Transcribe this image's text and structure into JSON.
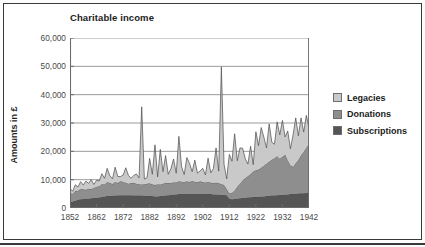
{
  "chart_data": {
    "type": "area",
    "stacked": true,
    "title": "Charitable income",
    "xlabel": "",
    "ylabel": "Amounts in £",
    "ylim": [
      0,
      60000
    ],
    "ytick_labels": [
      "0",
      "10,000",
      "20,000",
      "30,000",
      "40,000",
      "50,000",
      "60,000"
    ],
    "ytick_values": [
      0,
      10000,
      20000,
      30000,
      40000,
      50000,
      60000
    ],
    "xlim": [
      1852,
      1942
    ],
    "xtick_labels": [
      "1852",
      "1862",
      "1872",
      "1882",
      "1892",
      "1902",
      "1912",
      "1922",
      "1932",
      "1942"
    ],
    "xtick_values": [
      1852,
      1862,
      1872,
      1882,
      1892,
      1902,
      1912,
      1922,
      1932,
      1942
    ],
    "grid": "horizontal",
    "legend_position": "right",
    "colors": {
      "legacies": "#c9c9c9",
      "donations": "#8e8e8e",
      "subscriptions": "#555555",
      "outline": "#3a3a3a",
      "gridline": "#8f8f8f",
      "axis": "#6a6a6a",
      "frame": "#3a3a3a"
    },
    "legend": [
      {
        "label": "Legacies",
        "color": "#c9c9c9"
      },
      {
        "label": "Donations",
        "color": "#8e8e8e"
      },
      {
        "label": "Subscriptions",
        "color": "#555555"
      }
    ],
    "x": [
      1852,
      1853,
      1854,
      1855,
      1856,
      1857,
      1858,
      1859,
      1860,
      1861,
      1862,
      1863,
      1864,
      1865,
      1866,
      1867,
      1868,
      1869,
      1870,
      1871,
      1872,
      1873,
      1874,
      1875,
      1876,
      1877,
      1878,
      1879,
      1880,
      1881,
      1882,
      1883,
      1884,
      1885,
      1886,
      1887,
      1888,
      1889,
      1890,
      1891,
      1892,
      1893,
      1894,
      1895,
      1896,
      1897,
      1898,
      1899,
      1900,
      1901,
      1902,
      1903,
      1904,
      1905,
      1906,
      1907,
      1908,
      1909,
      1910,
      1911,
      1912,
      1913,
      1914,
      1915,
      1916,
      1917,
      1918,
      1919,
      1920,
      1921,
      1922,
      1923,
      1924,
      1925,
      1926,
      1927,
      1928,
      1929,
      1930,
      1931,
      1932,
      1933,
      1934,
      1935,
      1936,
      1937,
      1938,
      1939,
      1940,
      1941,
      1942
    ],
    "series": [
      {
        "name": "Subscriptions",
        "color": "#555555",
        "values": [
          1900,
          2300,
          2600,
          2900,
          3100,
          3200,
          3300,
          3300,
          3400,
          3500,
          3600,
          3700,
          3900,
          4100,
          4200,
          4300,
          4300,
          4400,
          4400,
          4500,
          4500,
          4500,
          4500,
          4500,
          4400,
          4400,
          4400,
          4400,
          4300,
          4300,
          4200,
          4200,
          4100,
          4100,
          4200,
          4300,
          4400,
          4500,
          4600,
          4700,
          4800,
          4900,
          5000,
          5000,
          5000,
          5000,
          5000,
          5000,
          5000,
          5000,
          5000,
          5000,
          4900,
          4900,
          4800,
          4800,
          4700,
          4700,
          4600,
          4500,
          3300,
          3100,
          3200,
          3300,
          3400,
          3500,
          3600,
          3700,
          3800,
          3900,
          3900,
          4000,
          4000,
          4100,
          4200,
          4300,
          4400,
          4400,
          4500,
          4600,
          4700,
          4700,
          4800,
          4900,
          5000,
          5000,
          5100,
          5200,
          5200,
          5300,
          5400
        ]
      },
      {
        "name": "Donations",
        "color": "#8e8e8e",
        "values": [
          3200,
          2700,
          3400,
          3200,
          3600,
          3400,
          3100,
          3500,
          3300,
          3600,
          3900,
          4000,
          4600,
          4200,
          5000,
          4500,
          4200,
          4800,
          4400,
          5000,
          4700,
          4400,
          4100,
          4300,
          4500,
          4200,
          4000,
          3900,
          4100,
          4300,
          4500,
          4200,
          4000,
          4300,
          4100,
          4300,
          4500,
          4300,
          4100,
          4400,
          4200,
          4500,
          4300,
          4100,
          4400,
          4200,
          4500,
          4300,
          4100,
          4400,
          4200,
          4000,
          4300,
          4100,
          3900,
          4200,
          4000,
          3800,
          3500,
          2200,
          1800,
          2200,
          3000,
          4200,
          5200,
          6200,
          7000,
          7500,
          8200,
          9000,
          9400,
          9600,
          10200,
          10800,
          11400,
          12000,
          12600,
          13200,
          13800,
          12800,
          13400,
          14200,
          12000,
          10200,
          9600,
          10800,
          11800,
          13400,
          14600,
          16000,
          17200
        ]
      },
      {
        "name": "Legacies",
        "color": "#c9c9c9",
        "values": [
          1800,
          900,
          2200,
          1300,
          2600,
          1500,
          3100,
          1900,
          3300,
          1200,
          2300,
          1800,
          3600,
          2200,
          4800,
          2600,
          1800,
          5200,
          2300,
          1600,
          2400,
          5300,
          2900,
          1700,
          2600,
          3400,
          2200,
          27400,
          1800,
          2100,
          8800,
          3500,
          14200,
          2600,
          12400,
          4200,
          9600,
          3100,
          5200,
          8200,
          3300,
          15900,
          5400,
          2700,
          8400,
          6600,
          3300,
          7600,
          3200,
          3700,
          4800,
          2700,
          8400,
          3400,
          5200,
          12200,
          4300,
          41300,
          7400,
          3600,
          13800,
          11200,
          20000,
          9200,
          12600,
          11400,
          6800,
          4300,
          9800,
          2400,
          13600,
          8400,
          14200,
          10100,
          5600,
          13400,
          6200,
          4900,
          12100,
          8400,
          12800,
          6200,
          10400,
          5800,
          11200,
          16000,
          8600,
          13200,
          7000,
          11400,
          5600
        ]
      }
    ],
    "annotations": [
      {
        "text": "peak ~36,000",
        "year": 1879
      },
      {
        "text": "peak ~50,000",
        "year": 1909
      }
    ]
  }
}
